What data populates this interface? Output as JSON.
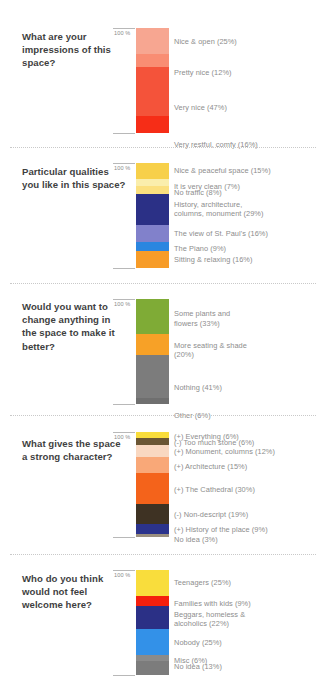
{
  "page": {
    "background": "#ffffff",
    "axis_label": "100 %",
    "title_color": "#3f3f3f",
    "label_color": "#8d8d8d"
  },
  "chart_data": [
    {
      "type": "bar",
      "title": "What are your impressions of this space?",
      "axis_label": "100 %",
      "ylim": [
        0,
        100
      ],
      "grid": false,
      "stacked": true,
      "orientation": "vertical",
      "categories": [
        "Nice & open",
        "Pretty nice",
        "Very nice",
        "Very restful, comfy"
      ],
      "values": [
        25,
        12,
        47,
        16
      ],
      "labels": [
        "Nice & open (25%)",
        "Pretty nice (12%)",
        "Very nice (47%)",
        "Very restful, comfy (16%)"
      ],
      "colors": [
        "#f7a691",
        "#f98d73",
        "#f4533a",
        "#f62d17"
      ],
      "xlabel": "",
      "ylabel": ""
    },
    {
      "type": "bar",
      "title": "Particular qualities you like in this space?",
      "axis_label": "100 %",
      "ylim": [
        0,
        100
      ],
      "grid": false,
      "stacked": true,
      "orientation": "vertical",
      "categories": [
        "Nice & peaceful space",
        "It is very clean",
        "No traffic",
        "History, architecture, columns, monument",
        "The view of St. Paul's",
        "The Piano",
        "Sitting & relaxing"
      ],
      "values": [
        15,
        7,
        8,
        29,
        16,
        9,
        16
      ],
      "labels": [
        "Nice & peaceful space (15%)",
        "It is very clean (7%)",
        "No traffic (8%)",
        "History, architecture,\ncolumns, monument (29%)",
        "The view of St. Paul's (16%)",
        "The Piano (9%)",
        "Sitting & relaxing (16%)"
      ],
      "colors": [
        "#f7d04a",
        "#faeeac",
        "#fbe07f",
        "#2b3086",
        "#8181cb",
        "#2b86e0",
        "#f79c28"
      ],
      "xlabel": "",
      "ylabel": ""
    },
    {
      "type": "bar",
      "title": "Would you want to change anything in the space to make it better?",
      "axis_label": "100 %",
      "ylim": [
        0,
        100
      ],
      "grid": false,
      "stacked": true,
      "orientation": "vertical",
      "categories": [
        "Some plants and flowers",
        "More seating & shade",
        "Nothing",
        "Other"
      ],
      "values": [
        33,
        20,
        41,
        6
      ],
      "labels": [
        "Some plants and\nflowers (33%)",
        "More seating & shade\n(20%)",
        "Nothing (41%)",
        "Other (6%)"
      ],
      "colors": [
        "#7fab36",
        "#f7a127",
        "#7c7c7c",
        "#6f6f6f"
      ],
      "xlabel": "",
      "ylabel": ""
    },
    {
      "type": "bar",
      "title": "What gives the space a strong character?",
      "axis_label": "100 %",
      "ylim": [
        0,
        100
      ],
      "grid": false,
      "stacked": true,
      "orientation": "vertical",
      "categories": [
        "(+) Everything",
        "(-) Too much stone",
        "(+) Monument, columns",
        "(+) Architecture",
        "(+) The Cathedral",
        "(-) Non-descript",
        "(+) History of the place",
        "No idea"
      ],
      "values": [
        6,
        6,
        12,
        15,
        30,
        19,
        9,
        3
      ],
      "labels": [
        "(+) Everything (6%)",
        "(-) Too much stone (6%)",
        "(+) Monument, columns (12%)",
        "(+) Architecture (15%)",
        "(+) The Cathedral (30%)",
        "(-) Non-descript (19%)",
        "(+) History of the place (9%)",
        "No idea (3%)"
      ],
      "colors": [
        "#f9dd3c",
        "#6b5634",
        "#f9d8c1",
        "#f9a878",
        "#f4631b",
        "#3e3223",
        "#2b338c",
        "#9a8f7f"
      ],
      "xlabel": "",
      "ylabel": ""
    },
    {
      "type": "bar",
      "title": "Who do you think would not feel welcome here?",
      "axis_label": "100 %",
      "ylim": [
        0,
        100
      ],
      "grid": false,
      "stacked": true,
      "orientation": "vertical",
      "categories": [
        "Teenagers",
        "Families with kids",
        "Beggars, homeless & alcoholics",
        "Nobody",
        "Misc",
        "No idea"
      ],
      "values": [
        25,
        9,
        22,
        25,
        6,
        13
      ],
      "labels": [
        "Teenagers (25%)",
        "Families with kids (9%)",
        "Beggars, homeless &\nalcoholics (22%)",
        "Nobody (25%)",
        "Misc (6%)",
        "No idea (13%)"
      ],
      "colors": [
        "#f9dd3c",
        "#f51f0d",
        "#2b3086",
        "#3391e8",
        "#8b8b8b",
        "#7c7c7c"
      ],
      "xlabel": "",
      "ylabel": ""
    }
  ],
  "sections": [
    {
      "id": "impressions",
      "title": "What are your impressions of this space?",
      "axis_label": "100 %",
      "top": 5,
      "bar_top": 28,
      "bar_height": 105,
      "title_top": 30,
      "separator_top": null,
      "label_offsets": [
        9,
        14,
        36,
        24
      ],
      "segments": [
        {
          "label": "Nice & open (25%)",
          "value": 25,
          "color": "#f7a691"
        },
        {
          "label": "Pretty nice (12%)",
          "value": 12,
          "color": "#f98d73"
        },
        {
          "label": "Very nice (47%)",
          "value": 47,
          "color": "#f4533a"
        },
        {
          "label": "Very restful, comfy (16%)",
          "value": 16,
          "color": "#f62d17"
        }
      ]
    },
    {
      "id": "qualities",
      "title": "Particular qualities you like in this space?",
      "axis_label": "100 %",
      "top": 150,
      "bar_top": 163,
      "bar_height": 105,
      "title_top": 165,
      "separator_top": 147,
      "label_offsets": [
        3,
        3,
        2,
        5,
        4,
        2,
        4
      ],
      "segments": [
        {
          "label": "Nice & peaceful space (15%)",
          "value": 15,
          "color": "#f7d04a"
        },
        {
          "label": "It is very clean (7%)",
          "value": 7,
          "color": "#faeeac"
        },
        {
          "label": "No traffic (8%)",
          "value": 8,
          "color": "#fbe07f"
        },
        {
          "label": "History, architecture,\ncolumns, monument (29%)",
          "value": 29,
          "color": "#2b3086"
        },
        {
          "label": "The view of St. Paul's (16%)",
          "value": 16,
          "color": "#8181cb"
        },
        {
          "label": "The Piano (9%)",
          "value": 9,
          "color": "#2b86e0"
        },
        {
          "label": "Sitting & relaxing (16%)",
          "value": 16,
          "color": "#f79c28"
        }
      ]
    },
    {
      "id": "change",
      "title": "Would you want to change anything in the space to make it better?",
      "axis_label": "100 %",
      "top": 288,
      "bar_top": 299,
      "bar_height": 105,
      "title_top": 300,
      "separator_top": 283,
      "label_offsets": [
        10,
        7,
        28,
        13
      ],
      "segments": [
        {
          "label": "Some plants and\nflowers (33%)",
          "value": 33,
          "color": "#7fab36"
        },
        {
          "label": "More seating & shade\n(20%)",
          "value": 20,
          "color": "#f7a127"
        },
        {
          "label": "Nothing (41%)",
          "value": 41,
          "color": "#7c7c7c"
        },
        {
          "label": "Other (6%)",
          "value": 6,
          "color": "#6f6f6f"
        }
      ]
    },
    {
      "id": "character",
      "title": "What gives the space a strong character?",
      "axis_label": "100 %",
      "top": 420,
      "bar_top": 432,
      "bar_height": 105,
      "title_top": 437,
      "separator_top": 415,
      "label_offsets": [
        0,
        0,
        2,
        5,
        12,
        6,
        1,
        1
      ],
      "segments": [
        {
          "label": "(+) Everything (6%)",
          "value": 6,
          "color": "#f9dd3c"
        },
        {
          "label": "(-) Too much stone (6%)",
          "value": 6,
          "color": "#6b5634"
        },
        {
          "label": "(+) Monument, columns (12%)",
          "value": 12,
          "color": "#f9d8c1"
        },
        {
          "label": "(+) Architecture (15%)",
          "value": 15,
          "color": "#f9a878"
        },
        {
          "label": "(+) The Cathedral (30%)",
          "value": 30,
          "color": "#f4631b"
        },
        {
          "label": "(-) Non-descript (19%)",
          "value": 19,
          "color": "#3e3223"
        },
        {
          "label": "(+) History of the place (9%)",
          "value": 9,
          "color": "#2b338c"
        },
        {
          "label": "No idea (3%)",
          "value": 3,
          "color": "#9a8f7f"
        }
      ]
    },
    {
      "id": "welcome",
      "title": "Who do you think would not feel welcome here?",
      "axis_label": "100 %",
      "top": 558,
      "bar_top": 570,
      "bar_height": 105,
      "title_top": 572,
      "separator_top": 554,
      "label_offsets": [
        8,
        3,
        4,
        9,
        1,
        1
      ],
      "segments": [
        {
          "label": "Teenagers (25%)",
          "value": 25,
          "color": "#f9dd3c"
        },
        {
          "label": "Families with kids (9%)",
          "value": 9,
          "color": "#f51f0d"
        },
        {
          "label": "Beggars, homeless &\nalcoholics (22%)",
          "value": 22,
          "color": "#2b3086"
        },
        {
          "label": "Nobody (25%)",
          "value": 25,
          "color": "#3391e8"
        },
        {
          "label": "Misc (6%)",
          "value": 6,
          "color": "#8b8b8b"
        },
        {
          "label": "No idea (13%)",
          "value": 13,
          "color": "#7c7c7c"
        }
      ]
    }
  ]
}
